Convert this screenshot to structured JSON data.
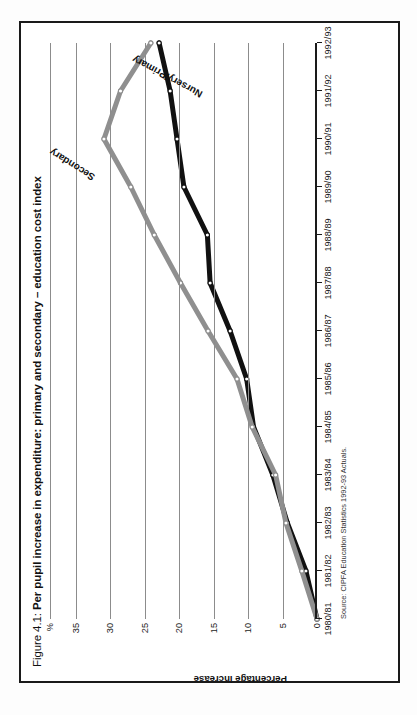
{
  "figure": {
    "number": "Figure 4.1:",
    "title": "Per pupil increase in expenditure: primary and secondary – education cost index",
    "source": "Source: CIPFA Education Statistics 1992-93 Actuals.",
    "orientation": "rotated-90-ccw",
    "frame_color": "#1a1a1a"
  },
  "chart_data": {
    "type": "line",
    "title": "Figure 4.1: Per pupil increase in expenditure: primary and secondary – education cost index",
    "xlabel": "",
    "ylabel": "Percentage increase",
    "unit_label": "%",
    "ylim": [
      0,
      38
    ],
    "yticks": [
      0,
      5,
      10,
      15,
      20,
      25,
      30,
      35
    ],
    "ytick_labels": [
      "0",
      "5",
      "10",
      "15",
      "20",
      "25",
      "30",
      "35"
    ],
    "grid": true,
    "grid_axis": "y",
    "legend": "inline-annotations",
    "categories": [
      "1980/81",
      "1981/82",
      "1982/83",
      "1983/84",
      "1984/85",
      "1985/86",
      "1986/87",
      "1987/88",
      "1988/89",
      "1989/90",
      "1990/91",
      "1991/92",
      "1992/93"
    ],
    "series": [
      {
        "name": "Nursery/Primary",
        "color": "#111111",
        "marker": "circle-open",
        "values": [
          0,
          1.6,
          4.3,
          6.4,
          9.2,
          10.2,
          12.6,
          15.5,
          15.9,
          19.3,
          20.3,
          21.3,
          22.9
        ]
      },
      {
        "name": "Secondary",
        "color": "#8f8f8f",
        "marker": "circle-open",
        "values": [
          0,
          2.2,
          4.5,
          6.0,
          9.4,
          11.6,
          15.8,
          19.8,
          23.6,
          27.0,
          30.9,
          28.5,
          24.1
        ]
      }
    ],
    "annotations": [
      {
        "text": "Secondary",
        "series": "Secondary"
      },
      {
        "text": "Nursery/Primary",
        "series": "Nursery/Primary"
      }
    ]
  }
}
